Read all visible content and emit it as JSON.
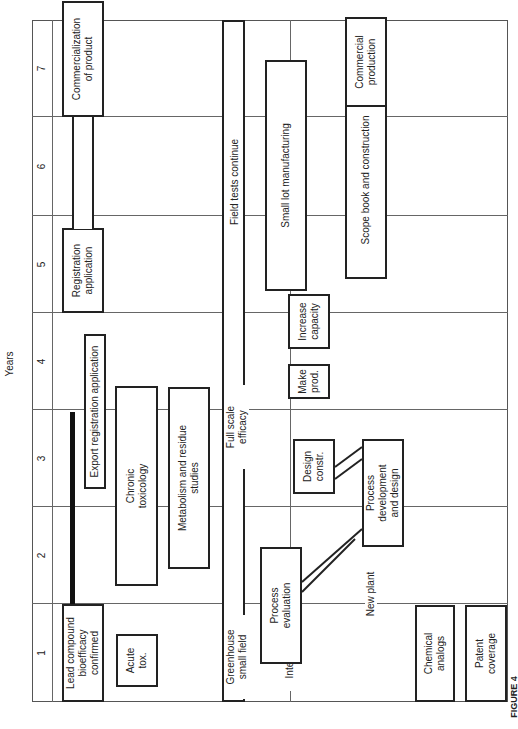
{
  "axis": {
    "title": "Years",
    "years": [
      "1",
      "2",
      "3",
      "4",
      "5",
      "6",
      "7"
    ]
  },
  "rows": {
    "registration": {
      "lead_compound": "Lead compound\nbioefficacy\nconfirmed",
      "export_registration": "Export registration application",
      "registration_application": "Registration\napplication",
      "commercialization": "Commercialization\nof product"
    },
    "toxicology": {
      "acute_tox": "Acute\ntox.",
      "chronic_tox": "Chronic\ntoxicology",
      "metabolism": "Metabolism and residue\nstudies"
    },
    "field": {
      "greenhouse": "Greenhouse\nsmall field",
      "full_scale": "Full scale\nefficacy",
      "field_tests": "Field tests continue"
    },
    "manufacturing": {
      "interim_facilities": "Interim facilities",
      "process_evaluation": "Process\nevaluation",
      "design_constr": "Design\nconstr.",
      "make_prod": "Make\nprod.",
      "increase_capacity": "Increase\ncapacity",
      "small_lot": "Small lot manufacturing"
    },
    "new_plant": {
      "new_plant": "New plant",
      "process_development": "Process\ndevelopment\nand design",
      "scope_book": "Scope book and construction",
      "commercial_production": "Commercial\nproduction"
    },
    "legal": {
      "chemical_analogs": "Chemical\nanalogs",
      "patent_coverage": "Patent\ncoverage"
    }
  },
  "caption": "FIGURE 4"
}
